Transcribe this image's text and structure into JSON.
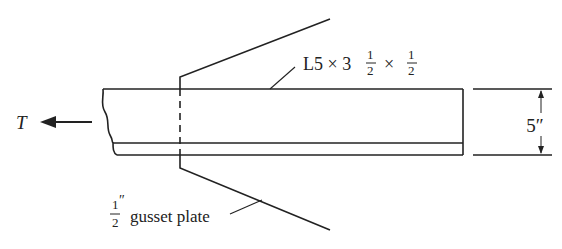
{
  "diagram": {
    "force_label": "T",
    "angle_label": {
      "prefix": "L5 × 3",
      "frac1_num": "1",
      "frac1_den": "2",
      "times": "×",
      "frac2_num": "1",
      "frac2_den": "2"
    },
    "gusset_label": {
      "frac_num": "1",
      "frac_den": "2",
      "unit": "″",
      "text": "gusset plate"
    },
    "dimension_label": "5″",
    "colors": {
      "line": "#222222",
      "background": "#ffffff"
    }
  }
}
